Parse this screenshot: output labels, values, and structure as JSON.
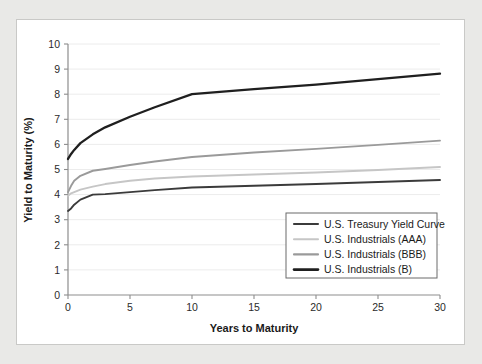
{
  "chart_data": {
    "type": "line",
    "title": "",
    "xlabel": "Years to Maturity",
    "ylabel": "Yield to Maturity (%)",
    "xlim": [
      0,
      30
    ],
    "ylim": [
      0,
      10
    ],
    "xticks": [
      0,
      5,
      10,
      15,
      20,
      25,
      30
    ],
    "yticks": [
      0,
      1,
      2,
      3,
      4,
      5,
      6,
      7,
      8,
      9,
      10
    ],
    "grid": "horizontal",
    "legend_position": "lower-right",
    "x": [
      0,
      0.25,
      0.5,
      1,
      2,
      3,
      5,
      7,
      10,
      15,
      20,
      25,
      30
    ],
    "series": [
      {
        "name": "U.S. Treasury Yield Curve",
        "color": "#3b3b3b",
        "values": [
          3.35,
          3.45,
          3.6,
          3.8,
          4.0,
          4.02,
          4.1,
          4.18,
          4.28,
          4.35,
          4.42,
          4.5,
          4.58
        ]
      },
      {
        "name": "U.S. Industrials (AAA)",
        "color": "#c6c6c6",
        "values": [
          3.95,
          4.05,
          4.1,
          4.2,
          4.32,
          4.42,
          4.55,
          4.64,
          4.72,
          4.8,
          4.88,
          4.98,
          5.1
        ]
      },
      {
        "name": "U.S. Industrials (BBB)",
        "color": "#9a9a9a",
        "values": [
          4.1,
          4.35,
          4.55,
          4.75,
          4.95,
          5.02,
          5.18,
          5.32,
          5.5,
          5.68,
          5.82,
          5.98,
          6.15
        ]
      },
      {
        "name": "U.S. Industrials (B)",
        "color": "#1f1f1f",
        "values": [
          5.42,
          5.62,
          5.78,
          6.05,
          6.4,
          6.68,
          7.1,
          7.48,
          8.0,
          8.2,
          8.38,
          8.6,
          8.82
        ]
      }
    ]
  },
  "axes": {
    "x_title": "Years to Maturity",
    "y_title": "Yield to Maturity (%)",
    "x_tick_labels": [
      "0",
      "5",
      "10",
      "15",
      "20",
      "25",
      "30"
    ],
    "y_tick_labels": [
      "0",
      "1",
      "2",
      "3",
      "4",
      "5",
      "6",
      "7",
      "8",
      "9",
      "10"
    ]
  },
  "legend": {
    "entries": [
      {
        "label": "U.S. Treasury Yield Curve",
        "color": "#3b3b3b"
      },
      {
        "label": "U.S. Industrials (AAA)",
        "color": "#c6c6c6"
      },
      {
        "label": "U.S. Industrials (BBB)",
        "color": "#9a9a9a"
      },
      {
        "label": "U.S. Industrials (B)",
        "color": "#1f1f1f"
      }
    ]
  },
  "colors": {
    "page_background": "#e9e9e7",
    "panel_background": "#ffffff",
    "panel_border": "#c9c9c7",
    "gridline": "#ececec",
    "axis": "#8d8d8d",
    "text": "#1a1a1a"
  }
}
